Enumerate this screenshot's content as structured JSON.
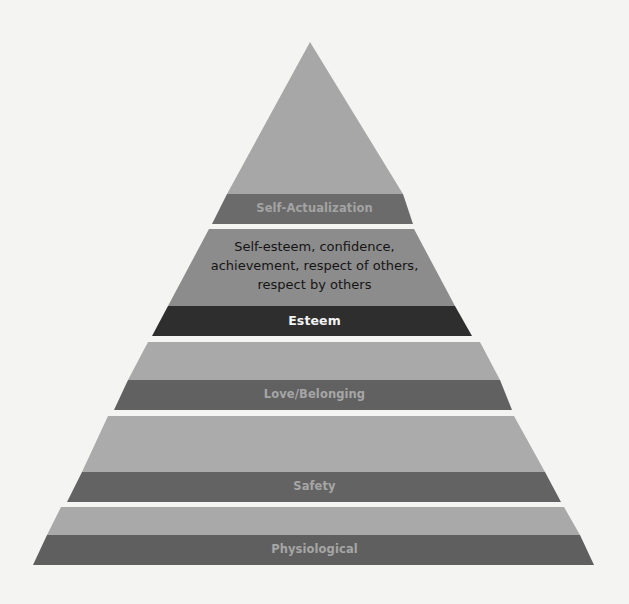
{
  "diagram": {
    "type": "pyramid",
    "title": "",
    "levels": [
      {
        "name": "Self-Actualization",
        "order_from_top": 1,
        "description": [],
        "fill_color": "#a7a7a7",
        "band_color": "#6b6b6b",
        "label_color": "#a3a3a3"
      },
      {
        "name": "Esteem",
        "order_from_top": 2,
        "description": [
          "Self-esteem, confidence,",
          "achievement, respect of others,",
          "respect by others"
        ],
        "fill_color": "#8c8c8c",
        "band_color": "#2e2e2e",
        "label_color": "#f2f2f2"
      },
      {
        "name": "Love/Belonging",
        "order_from_top": 3,
        "description": [],
        "fill_color": "#a9a9a9",
        "band_color": "#616161",
        "label_color": "#a6a6a6"
      },
      {
        "name": "Safety",
        "order_from_top": 4,
        "description": [],
        "fill_color": "#ababab",
        "band_color": "#636363",
        "label_color": "#a6a6a6"
      },
      {
        "name": "Physiological",
        "order_from_top": 5,
        "description": [],
        "fill_color": "#a9a9a9",
        "band_color": "#5f5f5f",
        "label_color": "#a6a6a6"
      }
    ]
  }
}
